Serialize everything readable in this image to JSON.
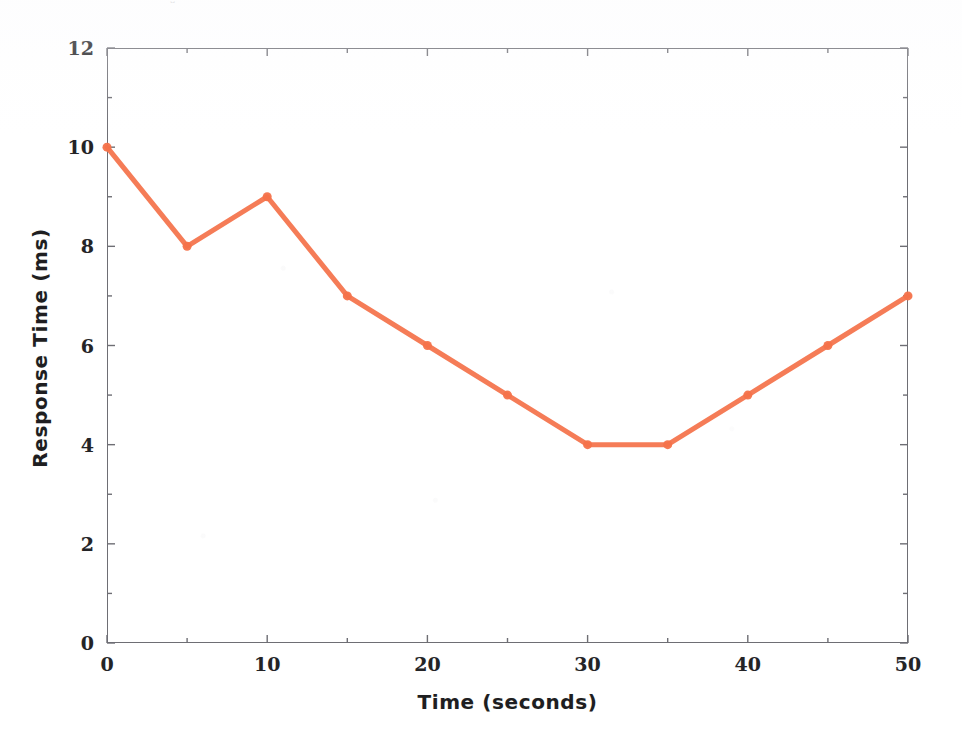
{
  "figure": {
    "title_artifact": "⌄",
    "background_color": "#ffffff",
    "frame_color": "#6e6e74"
  },
  "chart_data": {
    "type": "line",
    "title": "",
    "xlabel": "Time (seconds)",
    "ylabel": "Response Time (ms)",
    "xlim": [
      0,
      50
    ],
    "ylim": [
      0,
      12
    ],
    "xticks": [
      0,
      10,
      20,
      30,
      40,
      50
    ],
    "yticks": [
      0,
      2,
      4,
      6,
      8,
      10,
      12
    ],
    "xtick_labels": [
      "0",
      "10",
      "20",
      "30",
      "40",
      "50"
    ],
    "ytick_labels": [
      "0",
      "2",
      "4",
      "6",
      "8",
      "10",
      "12"
    ],
    "x_minor_tick_step": 5,
    "y_minor_tick_step": 2,
    "grid": false,
    "legend": false,
    "legend_position": "none",
    "x": [
      0,
      5,
      10,
      15,
      20,
      25,
      30,
      35,
      40,
      45,
      50
    ],
    "values": [
      10,
      8,
      9,
      7,
      6,
      5,
      4,
      4,
      5,
      6,
      7
    ],
    "series": [
      {
        "name": "Response Time",
        "color": "#f4724a",
        "line_width": 5,
        "marker": "circle",
        "marker_size": 9,
        "x": [
          0,
          5,
          10,
          15,
          20,
          25,
          30,
          35,
          40,
          45,
          50
        ],
        "values": [
          10,
          8,
          9,
          7,
          6,
          5,
          4,
          4,
          5,
          6,
          7
        ]
      }
    ]
  }
}
